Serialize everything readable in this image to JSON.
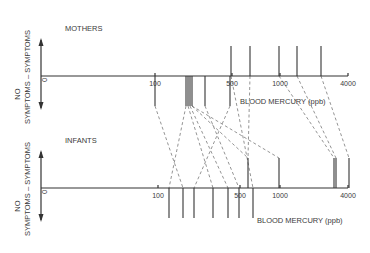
{
  "panels": [
    {
      "id": "mothers",
      "title": "MOTHERS",
      "axis_y": 76,
      "axis_x0": 41,
      "axis_x1": 348,
      "up_label": "SYMPTOMS",
      "down_label": "NO SYMPTOMS",
      "axis_title": "BLOOD MERCURY (ppb)",
      "ticks": [
        {
          "label": "0",
          "x": 41
        },
        {
          "label": "100",
          "x": 155
        },
        {
          "label": "500",
          "x": 232
        },
        {
          "label": "1000",
          "x": 280
        },
        {
          "label": "4000",
          "x": 348
        }
      ],
      "symptom_lines_x": [
        231,
        250,
        279,
        297,
        321
      ],
      "no_symptom_lines_x": [
        155,
        186,
        188,
        190,
        192,
        205,
        230
      ]
    },
    {
      "id": "infants",
      "title": "INFANTS",
      "axis_y": 188,
      "axis_x0": 41,
      "axis_x1": 348,
      "up_label": "SYMPTOMS",
      "down_label": "NO SYMPTOMS",
      "axis_title": "BLOOD MERCURY (ppb)",
      "ticks": [
        {
          "label": "0",
          "x": 41
        },
        {
          "label": "100",
          "x": 158
        },
        {
          "label": "500",
          "x": 240
        },
        {
          "label": "1000",
          "x": 280
        },
        {
          "label": "4000",
          "x": 348
        }
      ],
      "symptom_lines_x": [
        248,
        279,
        334,
        336,
        349
      ],
      "no_symptom_lines_x": [
        169,
        183,
        194,
        213,
        228,
        239,
        253
      ]
    }
  ],
  "pair_links": [
    [
      155,
      183
    ],
    [
      186,
      169
    ],
    [
      188,
      213
    ],
    [
      190,
      228
    ],
    [
      192,
      248
    ],
    [
      205,
      239
    ],
    [
      230,
      194
    ],
    [
      231,
      253
    ],
    [
      250,
      248
    ],
    [
      279,
      334
    ],
    [
      297,
      336
    ],
    [
      321,
      349
    ],
    [
      192,
      279
    ]
  ],
  "chart_data": {
    "type": "scatter",
    "xlabel": "BLOOD MERCURY (ppb)",
    "x_scale": "nonlinear (0,100,500,1000,4000 ticks)",
    "series": [
      {
        "name": "Mothers - symptoms",
        "approx_ppb": [
          480,
          600,
          1000,
          1500,
          2500
        ]
      },
      {
        "name": "Mothers - no symptoms",
        "approx_ppb": [
          100,
          200,
          210,
          220,
          230,
          300,
          470
        ]
      },
      {
        "name": "Infants - symptoms",
        "approx_ppb": [
          530,
          1000,
          3500,
          3600,
          4000
        ]
      },
      {
        "name": "Infants - no symptoms",
        "approx_ppb": [
          130,
          170,
          200,
          280,
          380,
          480,
          600
        ]
      }
    ],
    "note": "Dashed lines connect mother-infant pairs"
  }
}
